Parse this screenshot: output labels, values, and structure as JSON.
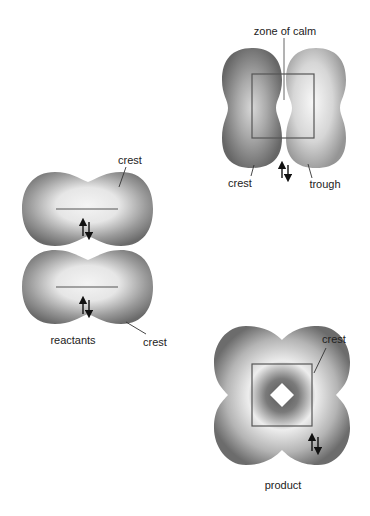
{
  "diagram": {
    "panels": {
      "reactants": {
        "caption": "reactants",
        "top_lobe_label": "crest",
        "bottom_lobe_label": "crest",
        "spin_symbol": "↑↓"
      },
      "transition": {
        "center_label": "zone of calm",
        "left_label": "crest",
        "right_label": "trough",
        "spin_symbol": "↑↓"
      },
      "product": {
        "caption": "product",
        "lobe_label": "crest",
        "spin_symbol": "↑↓"
      }
    },
    "colors": {
      "dark_lobe": "#6e6e6e",
      "mid_lobe": "#8a8a8a",
      "light_center": "#f2f2f2",
      "trough_lobe": "#b0b0b0",
      "line": "#555555",
      "text": "#222222"
    }
  }
}
